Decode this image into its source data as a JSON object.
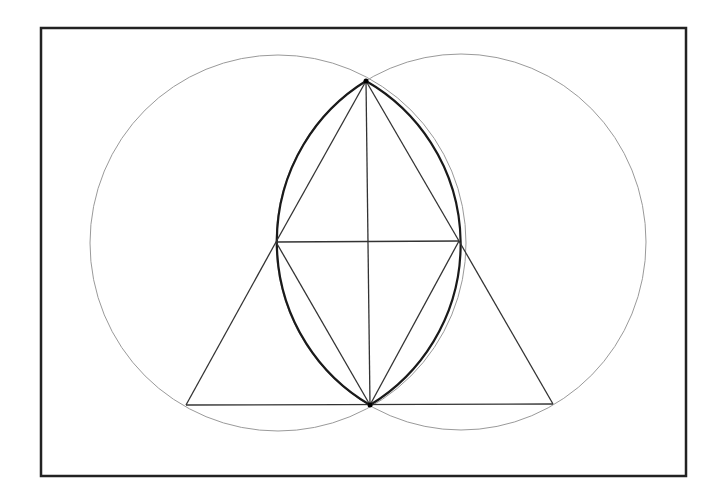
{
  "diagram": {
    "type": "geometric-construction",
    "colors": {
      "background": "#ffffff",
      "frame": "#222222",
      "circles": "#9a9a9a",
      "lens": "#1a1a1a",
      "lines": "#333333"
    },
    "frame": {
      "x": 41,
      "y": 28,
      "w": 645,
      "h": 448
    },
    "circles": [
      {
        "name": "left-circle",
        "cx": 278,
        "cy": 243,
        "rx": 188,
        "ry": 188
      },
      {
        "name": "right-circle",
        "cx": 461,
        "cy": 242,
        "rx": 185,
        "ry": 188
      }
    ],
    "points": {
      "top": [
        366,
        81
      ],
      "bottom": [
        370,
        405
      ],
      "left_mid": [
        276,
        242
      ],
      "right_mid": [
        459,
        241
      ],
      "bottom_left": [
        186,
        405
      ],
      "bottom_right": [
        553,
        404
      ]
    },
    "segments": [
      {
        "name": "vertical-axis",
        "from": "top",
        "to": "bottom"
      },
      {
        "name": "horizontal-chord",
        "from": "left_mid",
        "to": "right_mid"
      },
      {
        "name": "top-left-edge",
        "from": "top",
        "to": "left_mid"
      },
      {
        "name": "top-right-edge",
        "from": "top",
        "to": "right_mid"
      },
      {
        "name": "bottom-left-edge",
        "from": "left_mid",
        "to": "bottom"
      },
      {
        "name": "bottom-right-edge",
        "from": "right_mid",
        "to": "bottom"
      },
      {
        "name": "outer-left-edge",
        "from": "left_mid",
        "to": "bottom_left"
      },
      {
        "name": "outer-right-edge",
        "from": "right_mid",
        "to": "bottom_right"
      },
      {
        "name": "base-line",
        "from": "bottom_left",
        "to": "bottom_right"
      }
    ]
  }
}
